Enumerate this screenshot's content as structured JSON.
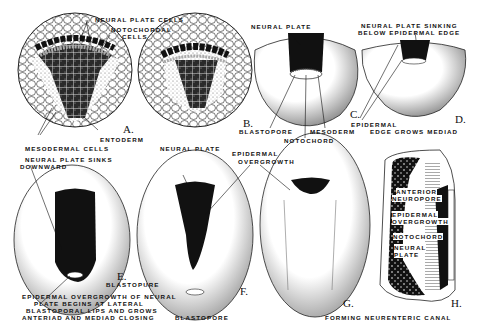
{
  "figure": {
    "panels": [
      {
        "id": "A",
        "letter": "A.",
        "labels": [
          "NEURAL PLATE CELLS",
          "NOTOCHORDAL",
          "CELLS",
          "ENTODERM",
          "MESODERMAL CELLS"
        ]
      },
      {
        "id": "B",
        "letter": "B.",
        "labels": []
      },
      {
        "id": "C",
        "letter": "C.",
        "labels": [
          "NEURAL PLATE",
          "BLASTOPORE",
          "MESODERM",
          "NOTOCHORD"
        ]
      },
      {
        "id": "D",
        "letter": "D.",
        "labels": [
          "NEURAL PLATE SINKING",
          "BELOW EPIDERMAL EDGE",
          "EPIDERMAL",
          "EDGE GROWS MEDIAD"
        ]
      },
      {
        "id": "E",
        "letter": "E.",
        "labels": [
          "NEURAL PLATE SINKS",
          "DOWNWARD",
          "BLASTOPURE",
          "EPIDERMAL OVERGROWTH OF NEURAL",
          "PLATE BEGINS AT LATERAL",
          "BLASTOPORAL LIPS AND GROWS",
          "ANTERIAD AND MEDIAD CLOSING"
        ]
      },
      {
        "id": "F",
        "letter": "F.",
        "labels": [
          "NEURAL PLATE",
          "BLASTOPORE"
        ]
      },
      {
        "id": "G",
        "letter": "G.",
        "labels": [
          "EPIDERMAL",
          "OVERGROWTH"
        ]
      },
      {
        "id": "H",
        "letter": "H.",
        "labels": [
          "ANTERIOR",
          "NEUROPORE",
          "EPIDERMAL",
          "OVERGROWTH",
          "NOTOCHORD",
          "NEURAL",
          "PLATE",
          "FORMING NEURENTERIC CANAL"
        ]
      }
    ]
  }
}
